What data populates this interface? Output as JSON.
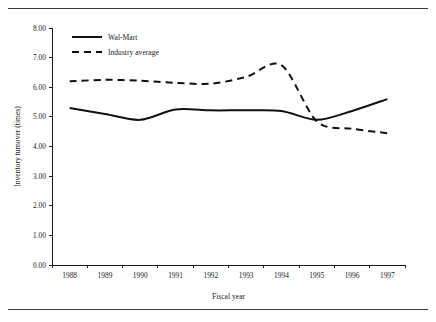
{
  "chart_data": {
    "type": "line",
    "title": "",
    "xlabel": "Fiscal year",
    "ylabel": "Inventory turnover (times)",
    "categories": [
      1988,
      1989,
      1990,
      1991,
      1992,
      1993,
      1994,
      1995,
      1996,
      1997
    ],
    "xtick_labels": [
      "1988",
      "1989",
      "1990",
      "1991",
      "1992",
      "1993",
      "1994",
      "1995",
      "1996",
      "1997"
    ],
    "ytick_labels": [
      "0.00",
      "1.00",
      "2.00",
      "3.00",
      "4.00",
      "5.00",
      "6.00",
      "7.00",
      "8.00"
    ],
    "ytick_values": [
      0,
      1,
      2,
      3,
      4,
      5,
      6,
      7,
      8
    ],
    "ylim": [
      0,
      8
    ],
    "grid": false,
    "legend_position": "top-left-inside",
    "series": [
      {
        "name": "Wal-Mart",
        "style": "solid",
        "color": "#111111",
        "values": [
          5.3,
          5.1,
          4.9,
          5.25,
          5.22,
          5.22,
          5.2,
          4.9,
          5.2,
          5.6
        ]
      },
      {
        "name": "Industry average",
        "style": "dashed",
        "color": "#111111",
        "values": [
          6.2,
          6.25,
          6.22,
          6.15,
          6.12,
          6.35,
          6.75,
          4.85,
          4.6,
          4.45
        ]
      }
    ]
  },
  "legend": {
    "entries": [
      {
        "label": "Wal-Mart",
        "style": "solid"
      },
      {
        "label": "Industry average",
        "style": "dashed"
      }
    ]
  },
  "axes": {
    "x_title": "Fiscal year",
    "y_title": "Inventory turnover (times)"
  }
}
